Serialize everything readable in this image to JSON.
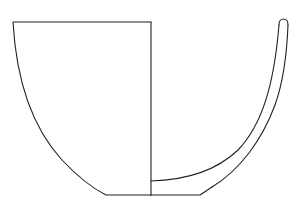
{
  "figure": {
    "type": "vessel-profile-drawing",
    "stroke_color": "#222222",
    "background": "#ffffff",
    "parts": {
      "exterior_view": "left half outline",
      "section": "right half wall cross-section",
      "rim": "rounded rim",
      "base": "flat base"
    }
  }
}
